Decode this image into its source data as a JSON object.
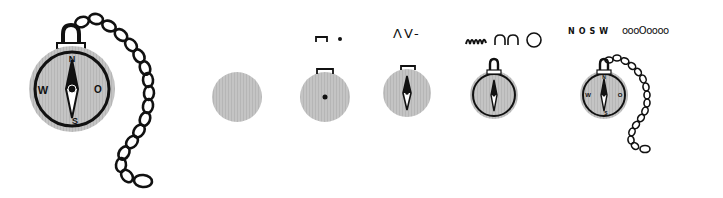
{
  "colors": {
    "ink": "#111111",
    "fill": "#b9b9b9",
    "background": "#ffffff"
  },
  "final_compass": {
    "labels": {
      "north": "N",
      "east": "O",
      "south": "S",
      "west": "W"
    }
  },
  "steps": [
    {
      "index": 1,
      "symbols": "",
      "description": "gray disc"
    },
    {
      "index": 2,
      "symbols": "⊓ •",
      "description": "disc with hanger and center dot"
    },
    {
      "index": 3,
      "symbols": "ΛV-",
      "description": "disc with needle"
    },
    {
      "index": 4,
      "symbols": "ɯɯ ∩∩ ○",
      "description": "outline, loop and ring"
    },
    {
      "index": 5,
      "symbols_text": "NOSW",
      "symbols_beads": "oooOoooo",
      "description": "letters and chain"
    }
  ]
}
